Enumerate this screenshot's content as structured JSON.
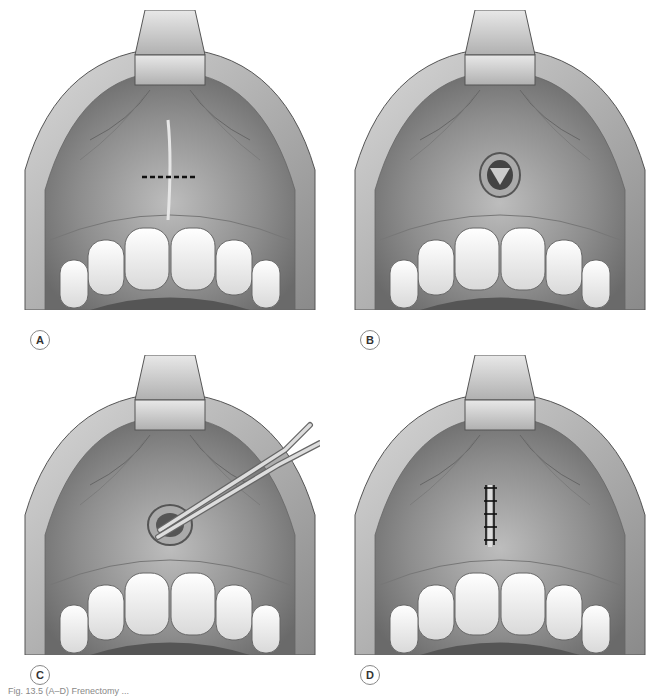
{
  "figure": {
    "panels": [
      {
        "id": "A",
        "label": "A",
        "stage": "incision-marked",
        "x": 20,
        "y": 10,
        "label_x": 30,
        "label_y": 330
      },
      {
        "id": "B",
        "label": "B",
        "stage": "frenum-excised",
        "x": 350,
        "y": 10,
        "label_x": 360,
        "label_y": 330
      },
      {
        "id": "C",
        "label": "C",
        "stage": "tissue-removal-with-forceps",
        "x": 20,
        "y": 355,
        "label_x": 30,
        "label_y": 665
      },
      {
        "id": "D",
        "label": "D",
        "stage": "sutured",
        "x": 350,
        "y": 355,
        "label_x": 360,
        "label_y": 665
      }
    ],
    "caption": "Fig. 13.5 (A–D) Frenectomy ..."
  }
}
